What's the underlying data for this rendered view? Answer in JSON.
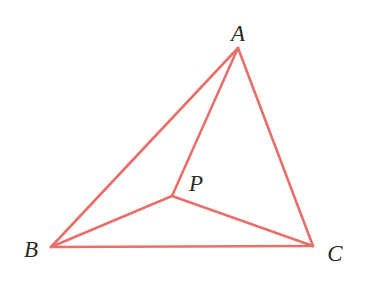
{
  "figure": {
    "type": "geometry-diagram",
    "canvas": {
      "width": 369,
      "height": 282
    },
    "background_color": "#ffffff",
    "stroke_color": "#e8706b",
    "stroke_width": 2.6,
    "label_color": "#2b2b2b"
  },
  "points": {
    "A": {
      "label": "A",
      "x": 238,
      "y": 48,
      "label_x": 238,
      "label_y": 33
    },
    "B": {
      "label": "B",
      "x": 51,
      "y": 247,
      "label_x": 31,
      "label_y": 249
    },
    "C": {
      "label": "C",
      "x": 313,
      "y": 246,
      "label_x": 335,
      "label_y": 253
    },
    "P": {
      "label": "P",
      "x": 172,
      "y": 196,
      "label_x": 196,
      "label_y": 183
    }
  },
  "segments": [
    {
      "name": "side-AB",
      "from": "A",
      "to": "B",
      "x1": 238,
      "y1": 48,
      "x2": 51,
      "y2": 247
    },
    {
      "name": "side-BC",
      "from": "B",
      "to": "C",
      "x1": 51,
      "y1": 247,
      "x2": 313,
      "y2": 246
    },
    {
      "name": "side-CA",
      "from": "C",
      "to": "A",
      "x1": 313,
      "y1": 246,
      "x2": 238,
      "y2": 48
    },
    {
      "name": "cevian-AP",
      "from": "A",
      "to": "P",
      "x1": 238,
      "y1": 48,
      "x2": 172,
      "y2": 196
    },
    {
      "name": "cevian-BP",
      "from": "B",
      "to": "P",
      "x1": 51,
      "y1": 247,
      "x2": 172,
      "y2": 196
    },
    {
      "name": "cevian-CP",
      "from": "C",
      "to": "P",
      "x1": 313,
      "y1": 246,
      "x2": 172,
      "y2": 196
    }
  ]
}
